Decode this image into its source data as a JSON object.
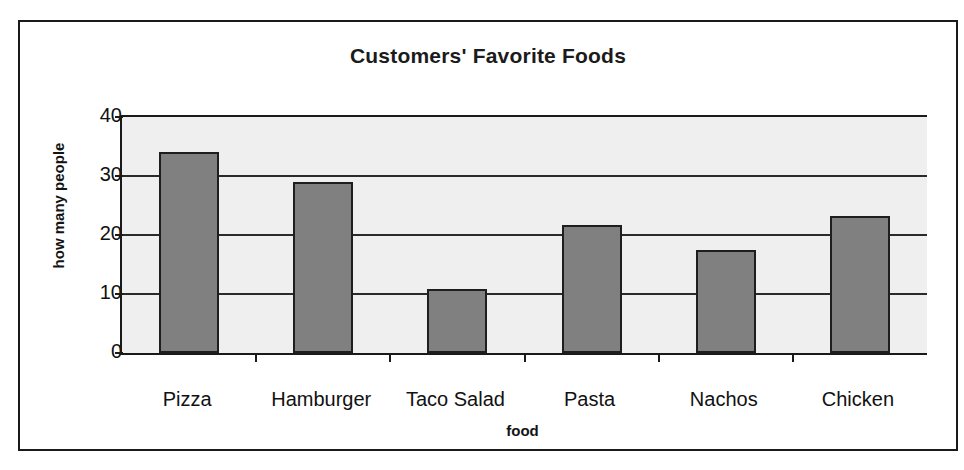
{
  "chart_data": {
    "type": "bar",
    "title": "Customers' Favorite Foods",
    "xlabel": "food",
    "ylabel": "how many people",
    "categories": [
      "Pizza",
      "Hamburger",
      "Taco Salad",
      "Pasta",
      "Nachos",
      "Chicken"
    ],
    "values": [
      34,
      29,
      10.8,
      21.7,
      17.5,
      23.2
    ],
    "ylim": [
      0,
      40
    ],
    "yticks": [
      0,
      10,
      20,
      30,
      40
    ],
    "ytick_labels": [
      "0",
      "10",
      "20",
      "30",
      "40"
    ],
    "grid": true,
    "legend": false,
    "colors": {
      "bar_fill": "#808080",
      "bar_outline": "#1e1e1e",
      "plot_background": "#efefef",
      "frame_border": "#1a1a1a",
      "text": "#111111"
    }
  }
}
